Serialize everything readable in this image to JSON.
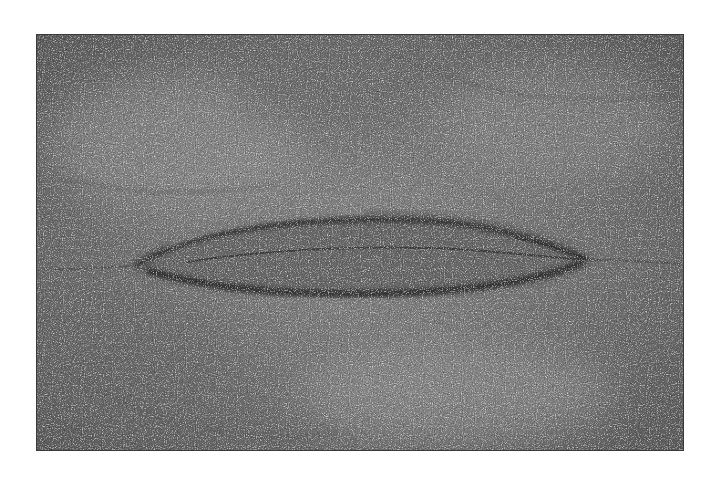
{
  "image": {
    "subject": "elongated fossil-like impression in grainy sandstone",
    "style": "grayscale photograph with white border",
    "colors": {
      "border": "#ffffff",
      "rock_mid": "#7a7a7a",
      "rock_dark": "#3a3a3a",
      "rock_light": "#b0b0b0"
    }
  }
}
